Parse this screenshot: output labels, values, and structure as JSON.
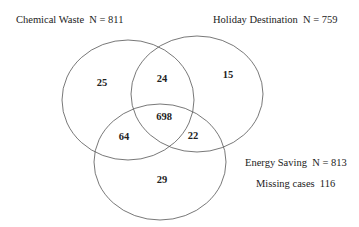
{
  "diagram": {
    "type": "venn-3",
    "sets": [
      {
        "name": "Chemical Waste",
        "n_label": "N = 811",
        "n": 811
      },
      {
        "name": "Holiday Destination",
        "n_label": "N = 759",
        "n": 759
      },
      {
        "name": "Energy Saving",
        "n_label": "N = 813",
        "n": 813
      }
    ],
    "titles": {
      "chemical_waste": "Chemical Waste  N = 811",
      "holiday_destination": "Holiday Destination  N = 759",
      "energy_saving": "Energy Saving  N = 813",
      "missing_cases": "Missing cases  116"
    },
    "regions": {
      "chemical_only": "25",
      "holiday_only": "15",
      "energy_only": "29",
      "chemical_holiday": "24",
      "chemical_energy": "64",
      "holiday_energy": "22",
      "all_three": "698"
    },
    "missing_cases": 116,
    "stroke_color": "#555555",
    "text_color": "#222222"
  }
}
